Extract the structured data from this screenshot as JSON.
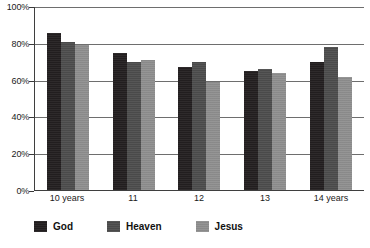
{
  "chart_data": {
    "type": "bar",
    "title": "",
    "xlabel": "",
    "ylabel": "",
    "ylim": [
      0,
      100
    ],
    "ytick_labels": [
      "100%",
      "80%",
      "60%",
      "40%",
      "20%",
      "0%"
    ],
    "ytick_values": [
      100,
      80,
      60,
      40,
      20,
      0
    ],
    "grid": true,
    "legend_position": "bottom",
    "categories": [
      "10 years",
      "11",
      "12",
      "13",
      "14 years"
    ],
    "series": [
      {
        "name": "God",
        "color": "#231f20",
        "values": [
          86,
          75,
          67,
          65,
          70
        ]
      },
      {
        "name": "Heaven",
        "color": "#4d4d4d",
        "values": [
          81,
          70,
          70,
          66,
          78
        ]
      },
      {
        "name": "Jesus",
        "color": "#8f8f8f",
        "values": [
          79,
          71,
          59,
          64,
          62
        ]
      }
    ]
  }
}
